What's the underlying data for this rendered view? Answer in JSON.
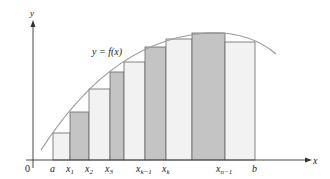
{
  "figure": {
    "curve_label": "y = f(x)",
    "axis_x_label": "x",
    "axis_y_label": "y",
    "origin_label": "0",
    "colors": {
      "axis": "#333333",
      "curve": "#9a9a9a",
      "bar_light": "#f2f2f2",
      "bar_dark": "#c4c4c4",
      "bar_stroke": "#666666"
    },
    "tick_labels": [
      {
        "text": "a",
        "sub": ""
      },
      {
        "text": "x",
        "sub": "1"
      },
      {
        "text": "x",
        "sub": "2"
      },
      {
        "text": "x",
        "sub": "3"
      },
      {
        "text": "x",
        "sub": "k−1"
      },
      {
        "text": "x",
        "sub": "k"
      },
      {
        "text": "x",
        "sub": "n−1"
      },
      {
        "text": "b",
        "sub": ""
      }
    ],
    "rectangles": [
      {
        "from": "a",
        "to": "x1",
        "shade": "light"
      },
      {
        "from": "x1",
        "to": "x2",
        "shade": "dark"
      },
      {
        "from": "x2",
        "to": "x3",
        "shade": "light"
      },
      {
        "from": "x3",
        "to": "…",
        "shade": "dark"
      },
      {
        "from": "…",
        "to": "xk-1",
        "shade": "light"
      },
      {
        "from": "xk-1",
        "to": "xk",
        "shade": "dark"
      },
      {
        "from": "xk",
        "to": "…",
        "shade": "light"
      },
      {
        "from": "…",
        "to": "xn-1",
        "shade": "dark"
      },
      {
        "from": "xn-1",
        "to": "b",
        "shade": "light"
      }
    ]
  }
}
